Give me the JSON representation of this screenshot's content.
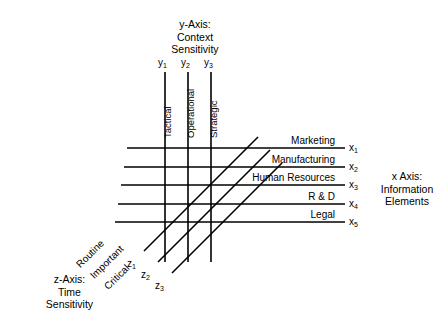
{
  "diagram": {
    "title_y_axis": "y-Axis:\nContext\nSensitivity",
    "y_axis": {
      "name_line1": "y-Axis:",
      "name_line2": "Context",
      "name_line3": "Sensitivity",
      "ticks": [
        {
          "id": "y1",
          "base": "y",
          "sub": "1",
          "label": "Tactical"
        },
        {
          "id": "y2",
          "base": "y",
          "sub": "2",
          "label": "Operational"
        },
        {
          "id": "y3",
          "base": "y",
          "sub": "3",
          "label": "Strategic"
        }
      ]
    },
    "x_axis": {
      "name_line1": "x Axis:",
      "name_line2": "Information",
      "name_line3": "Elements",
      "ticks": [
        {
          "id": "x1",
          "base": "x",
          "sub": "1",
          "label": "Marketing"
        },
        {
          "id": "x2",
          "base": "x",
          "sub": "2",
          "label": "Manufacturing"
        },
        {
          "id": "x3",
          "base": "x",
          "sub": "3",
          "label": "Human Resources"
        },
        {
          "id": "x4",
          "base": "x",
          "sub": "4",
          "label": "R & D"
        },
        {
          "id": "x5",
          "base": "x",
          "sub": "5",
          "label": "Legal"
        }
      ]
    },
    "z_axis": {
      "name_line1": "z-Axis:",
      "name_line2": "Time",
      "name_line3": "Sensitivity",
      "ticks": [
        {
          "id": "z1",
          "base": "z",
          "sub": "1",
          "label": "Routine"
        },
        {
          "id": "z2",
          "base": "z",
          "sub": "2",
          "label": "Important"
        },
        {
          "id": "z3",
          "base": "z",
          "sub": "3",
          "label": "Critical"
        }
      ]
    },
    "style": {
      "line_color": "#000000",
      "background": "#ffffff"
    }
  }
}
